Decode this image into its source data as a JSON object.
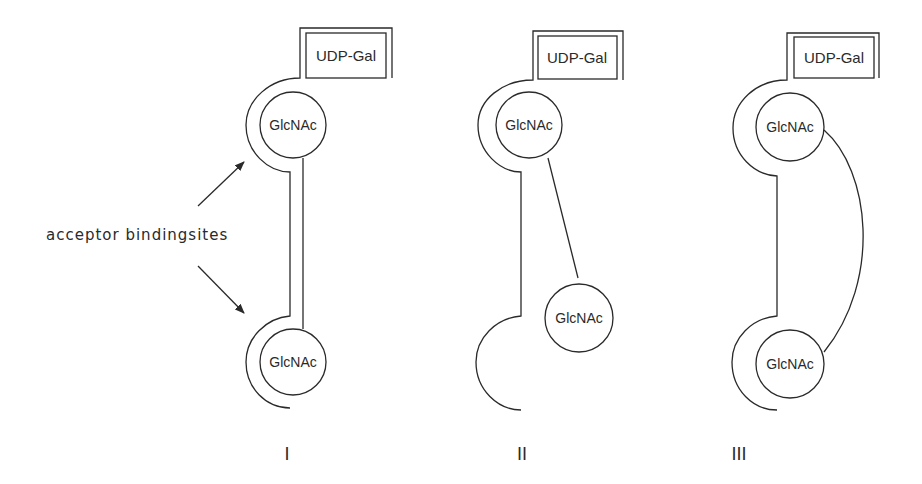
{
  "diagram": {
    "annotation": {
      "label": "acceptor bindingsites",
      "arrows": [
        "upper-binding-site",
        "lower-binding-site"
      ]
    },
    "panels": [
      {
        "numeral": "I",
        "donor_label": "UDP-Gal",
        "sugar_top_label": "GlcNAc",
        "sugar_bottom_label": "GlcNAc",
        "linker": "straight-vertical"
      },
      {
        "numeral": "II",
        "donor_label": "UDP-Gal",
        "sugar_top_label": "GlcNAc",
        "sugar_bottom_label": "GlcNAc",
        "linker": "straight-diagonal"
      },
      {
        "numeral": "III",
        "donor_label": "UDP-Gal",
        "sugar_top_label": "GlcNAc",
        "sugar_bottom_label": "GlcNAc",
        "linker": "curved"
      }
    ],
    "colors": {
      "line": "#2a2a2a",
      "background": "#ffffff"
    }
  }
}
